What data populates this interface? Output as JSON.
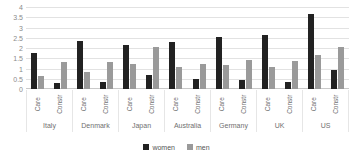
{
  "chart_data": {
    "type": "bar",
    "title": "",
    "xlabel": "",
    "ylabel": "",
    "ylim": [
      0,
      4
    ],
    "grid": true,
    "legend_position": "bottom",
    "yticks": [
      "4",
      "3.5",
      "3",
      "2.5",
      "2",
      "1.5",
      "1",
      "0.5",
      "0"
    ],
    "ytick_values": [
      4,
      3.5,
      3,
      2.5,
      2,
      1.5,
      1,
      0.5,
      0
    ],
    "countries": [
      "Italy",
      "Denmark",
      "Japan",
      "Australia",
      "Germany",
      "UK",
      "US"
    ],
    "sectors": [
      "Care",
      "Constr"
    ],
    "categories": [
      "Italy Care",
      "Italy Constr",
      "Denmark Care",
      "Denmark Constr",
      "Japan Care",
      "Japan Constr",
      "Australia Care",
      "Australia Constr",
      "Germany Care",
      "Germany Constr",
      "UK Care",
      "UK Constr",
      "US Care",
      "US Constr"
    ],
    "series": [
      {
        "name": "women",
        "color": "#222222",
        "values": [
          1.75,
          0.3,
          2.35,
          0.35,
          2.15,
          0.68,
          2.3,
          0.5,
          2.52,
          0.45,
          2.62,
          0.33,
          3.65,
          0.95
        ]
      },
      {
        "name": "men",
        "color": "#9a9a9a",
        "values": [
          0.62,
          1.32,
          0.85,
          1.3,
          1.2,
          2.05,
          1.05,
          1.2,
          1.15,
          1.4,
          1.05,
          1.38,
          1.65,
          2.05
        ]
      }
    ],
    "groups": [
      {
        "country": "Italy",
        "sectors": [
          {
            "label": "Care",
            "women": 1.75,
            "men": 0.62
          },
          {
            "label": "Constr",
            "women": 0.3,
            "men": 1.32
          }
        ]
      },
      {
        "country": "Denmark",
        "sectors": [
          {
            "label": "Care",
            "women": 2.35,
            "men": 0.85
          },
          {
            "label": "Constr",
            "women": 0.35,
            "men": 1.3
          }
        ]
      },
      {
        "country": "Japan",
        "sectors": [
          {
            "label": "Care",
            "women": 2.15,
            "men": 1.2
          },
          {
            "label": "Constr",
            "women": 0.68,
            "men": 2.05
          }
        ]
      },
      {
        "country": "Australia",
        "sectors": [
          {
            "label": "Care",
            "women": 2.3,
            "men": 1.05
          },
          {
            "label": "Constr",
            "women": 0.5,
            "men": 1.2
          }
        ]
      },
      {
        "country": "Germany",
        "sectors": [
          {
            "label": "Care",
            "women": 2.52,
            "men": 1.15
          },
          {
            "label": "Constr",
            "women": 0.45,
            "men": 1.4
          }
        ]
      },
      {
        "country": "UK",
        "sectors": [
          {
            "label": "Care",
            "women": 2.62,
            "men": 1.05
          },
          {
            "label": "Constr",
            "women": 0.33,
            "men": 1.38
          }
        ]
      },
      {
        "country": "US",
        "sectors": [
          {
            "label": "Care",
            "women": 3.65,
            "men": 1.65
          },
          {
            "label": "Constr",
            "women": 0.95,
            "men": 2.05
          }
        ]
      }
    ],
    "legend": [
      {
        "label": "women",
        "color": "#222222"
      },
      {
        "label": "men",
        "color": "#9a9a9a"
      }
    ]
  }
}
